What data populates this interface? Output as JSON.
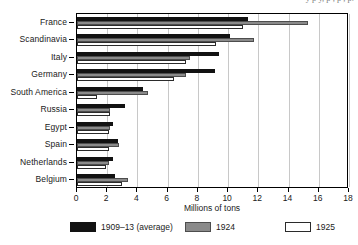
{
  "figure": {
    "cropped_caption_top": "y  p    y,    p       ,   p         ,  p."
  },
  "chart_data": {
    "type": "bar",
    "orientation": "horizontal",
    "title": "",
    "xlabel": "Millions of tons",
    "ylabel": "",
    "xlim": [
      0,
      18
    ],
    "xticks": [
      0,
      2,
      4,
      6,
      8,
      10,
      12,
      14,
      16,
      18
    ],
    "grid": "vertical",
    "legend_position": "bottom",
    "categories": [
      "France",
      "Scandinavia",
      "Italy",
      "Germany",
      "South America",
      "Russia",
      "Egypt",
      "Spain",
      "Netherlands",
      "Belgium"
    ],
    "series": [
      {
        "name": "1909–13 (average)",
        "color": "#121212",
        "values": [
          11.3,
          10.1,
          9.4,
          9.1,
          4.4,
          3.2,
          2.4,
          2.7,
          2.4,
          2.5
        ]
      },
      {
        "name": "1924",
        "color": "#8a8a8a",
        "values": [
          15.3,
          11.7,
          7.5,
          7.2,
          4.7,
          2.2,
          2.2,
          2.8,
          2.1,
          3.4
        ]
      },
      {
        "name": "1925",
        "color": "#ffffff",
        "values": [
          11.0,
          9.2,
          7.2,
          6.4,
          1.3,
          2.2,
          2.1,
          2.1,
          1.9,
          3.0
        ]
      }
    ]
  }
}
